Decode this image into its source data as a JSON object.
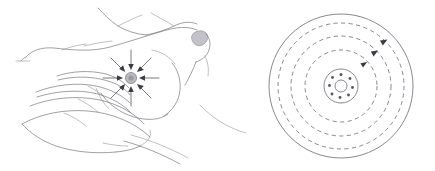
{
  "figure": {
    "title": "Tactile stimulus and concentric wave propagation diagram",
    "width": 435,
    "height": 171,
    "background_color": "#ffffff",
    "ink_color": "#5a5a62",
    "accent_gray": "#b9b9bf",
    "arrow_color": "#3c3c44"
  },
  "panels": [
    {
      "id": "left",
      "name": "hand-stimulus-panel",
      "caption": "",
      "description": "Line drawing of a hand with fingers extended contacting a radiating point stimulus",
      "elements": {
        "hand_outline": "hand with extended fingers, dorsal contour and forearm strokes",
        "thumb_nail": "small filled gray oval at upper right of hand",
        "stimulus_center": "filled gray disc at the point of contact",
        "ray_count": 8,
        "ray_direction": "inward",
        "ray_description": "eight straight rays ending in arrowheads pointing inward toward the central gray disc"
      }
    },
    {
      "id": "right",
      "name": "concentric-wave-panel",
      "caption": "",
      "description": "Concentric circular wavefronts radiating from a central hub with clockwise direction arrows",
      "elements": {
        "outer_circle": "solid outer boundary circle",
        "dashed_ring_count": 3,
        "dashed_ring_style": "dashed",
        "arrowhead_count": 3,
        "arrow_direction": "clockwise",
        "hub": "small central circle containing an inner ring and scattered dots",
        "hub_dot_count": 8
      }
    }
  ],
  "geometry": {
    "right_panel_center": {
      "x": 341,
      "y": 86
    },
    "outer_radius": 72,
    "dashed_radii": [
      63,
      50,
      36
    ],
    "hub_radius": 17,
    "hub_inner_radius": 6,
    "left_stimulus_center": {
      "x": 131,
      "y": 78
    },
    "left_stimulus_radius": 5.5,
    "left_ray_length": 24
  }
}
